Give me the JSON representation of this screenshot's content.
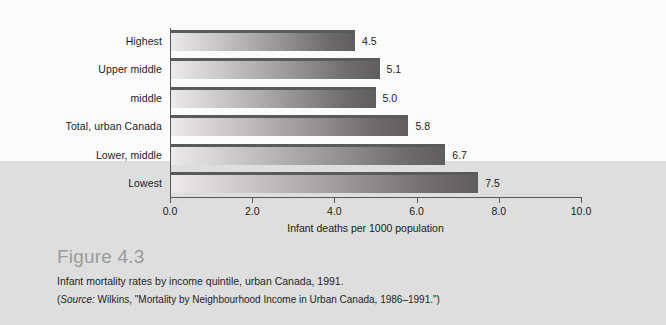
{
  "figure": {
    "number_label": "Figure 4.3",
    "description": "Infant mortality rates by income quintile, urban Canada, 1991.",
    "source_prefix": "(",
    "source_word": "Source:",
    "source_text": " Wilkins, \"Mortality by Neighbourhood Income in Urban Canada, 1986–1991.\")"
  },
  "chart_data": {
    "type": "bar",
    "orientation": "horizontal",
    "title": "",
    "categories": [
      "Highest",
      "Upper middle",
      "middle",
      "Total, urban Canada",
      "Lower, middle",
      "Lowest"
    ],
    "values": [
      4.5,
      5.1,
      5.0,
      5.8,
      6.7,
      7.5
    ],
    "value_labels": [
      "4.5",
      "5.1",
      "5.0",
      "5.8",
      "6.7",
      "7.5"
    ],
    "xlabel": "Infant deaths per 1000 population",
    "ylabel": "",
    "xlim": [
      0.0,
      10.0
    ],
    "xticks": [
      0.0,
      2.0,
      4.0,
      6.0,
      8.0,
      10.0
    ],
    "xtick_labels": [
      "0.0",
      "2.0",
      "4.0",
      "6.0",
      "8.0",
      "10.0"
    ],
    "grid": false,
    "legend": "none",
    "bar_gradient_start": "#eceaea",
    "bar_gradient_end": "#5f5d5d",
    "bar_top_edge_color": "#5a5a5a",
    "axis_color": "#575757",
    "band_top_color": "#fbfbfb",
    "band_bottom_color": "#dedede"
  }
}
